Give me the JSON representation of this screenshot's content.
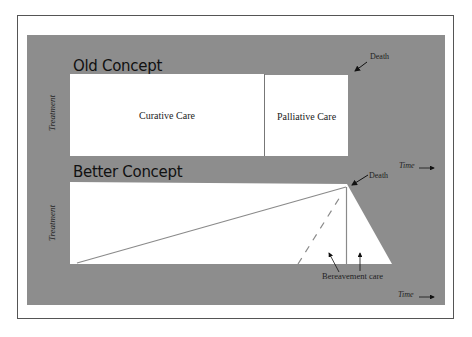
{
  "old_concept": {
    "title": "Old Concept",
    "y_axis_label": "Treatment",
    "segments": [
      {
        "label": "Curative Care"
      },
      {
        "label": "Palliative Care"
      }
    ],
    "death_label": "Death"
  },
  "better_concept": {
    "title": "Better Concept",
    "y_axis_label": "Treatment",
    "time_label_top": "Time",
    "death_label": "Death",
    "region_upper_label_line1": "Disease modifying or",
    "region_upper_label_line2": "potentially curative",
    "region_lower_label_line1": "Supportive and",
    "region_lower_label_line2": "palliative care",
    "bereavement_label": "Bereavement care",
    "time_label_bottom": "Time"
  },
  "colors": {
    "panel_bg": "#8d8d8d",
    "box_fill": "#ffffff",
    "line": "#8a8a8a",
    "text": "#222222"
  }
}
